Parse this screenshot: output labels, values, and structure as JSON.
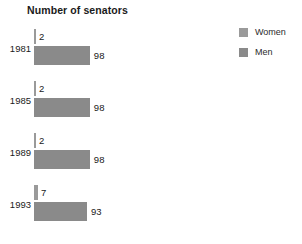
{
  "chart_data": {
    "type": "bar",
    "title": "Number of senators",
    "xlabel": "",
    "ylabel": "",
    "orientation": "horizontal",
    "grid": false,
    "legend_position": "top-right",
    "categories": [
      "1981",
      "1985",
      "1989",
      "1993"
    ],
    "xlim": [
      0,
      100
    ],
    "series": [
      {
        "name": "Women",
        "color": "#9a9a9a",
        "values": [
          2,
          2,
          2,
          7
        ],
        "labels": [
          "2",
          "2",
          "2",
          "7"
        ]
      },
      {
        "name": "Men",
        "color": "#8a8a8a",
        "values": [
          98,
          98,
          98,
          93
        ],
        "labels": [
          "98",
          "98",
          "98",
          "93"
        ]
      }
    ]
  },
  "legend": {
    "items": [
      {
        "label": "Women",
        "color": "#9a9a9a"
      },
      {
        "label": "Men",
        "color": "#8a8a8a"
      }
    ]
  },
  "groups": [
    {
      "year": "1981",
      "women": {
        "value": 2,
        "label": "2"
      },
      "men": {
        "value": 98,
        "label": "98"
      }
    },
    {
      "year": "1985",
      "women": {
        "value": 2,
        "label": "2"
      },
      "men": {
        "value": 98,
        "label": "98"
      }
    },
    {
      "year": "1989",
      "women": {
        "value": 2,
        "label": "2"
      },
      "men": {
        "value": 98,
        "label": "98"
      }
    },
    {
      "year": "1993",
      "women": {
        "value": 7,
        "label": "7"
      },
      "men": {
        "value": 93,
        "label": "93"
      }
    }
  ],
  "scale": {
    "pixels_per_unit": 0.57,
    "min_bar_px": 2
  }
}
